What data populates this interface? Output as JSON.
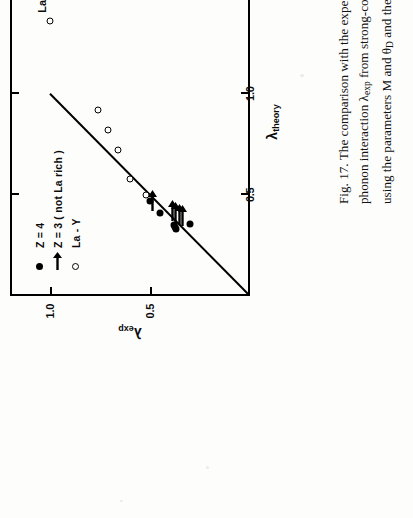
{
  "figure": {
    "number": "Fig. 17.",
    "caption_lines": [
      "Fig. 17.   The comparison with the experimentally determined electron",
      "phonon interaction λexp from strong-coupling theory, with the prediction",
      "using the parameters M and θD and the empirical formula (Eq. 22) given",
      "in the text."
    ],
    "caption_l1": "Fig. 17.   The comparison with the experimentally determined electron",
    "caption_l2a": "phonon interaction ",
    "caption_l2lam": "λ",
    "caption_l2sub": "exp",
    "caption_l2b": " from strong-coupling theory, with the prediction",
    "caption_l3a": "using the parameters M and ",
    "caption_l3theta": "θ",
    "caption_l3sub": "D",
    "caption_l3b": " and the empirical formula (Eq. 22) given",
    "caption_l4": "in the text."
  },
  "axes": {
    "x": {
      "title_symbol": "λ",
      "title_sub": "theory",
      "ticks": [
        "0.5",
        "1.0",
        "1.5"
      ],
      "tick_values": [
        0.5,
        1.0,
        1.5
      ],
      "range": [
        0,
        1.72
      ]
    },
    "y": {
      "title_symbol": "λ",
      "title_sub": "exp",
      "ticks": [
        "0.5",
        "1.0"
      ],
      "tick_values": [
        0.5,
        1.0
      ],
      "range": [
        0,
        1.2
      ]
    }
  },
  "legend": {
    "items": [
      {
        "symbol": "filled-circle",
        "label": "Z = 4"
      },
      {
        "symbol": "right-arrow",
        "label": "Z = 3  ( not La rich )"
      },
      {
        "symbol": "open-circle",
        "label": "La - Y"
      }
    ]
  },
  "annotations": [
    {
      "text": "La",
      "x": 1.36,
      "y": 1.04
    }
  ],
  "chart_data": {
    "type": "scatter",
    "title": "",
    "xlabel": "λ_theory",
    "ylabel": "λ_exp",
    "xlim": [
      0,
      1.72
    ],
    "ylim": [
      0,
      1.2
    ],
    "grid": false,
    "legend_position": "upper-left",
    "reference_line": {
      "label": "1:1 line",
      "x": [
        0.0,
        1.0
      ],
      "y": [
        0.0,
        1.0
      ]
    },
    "series": [
      {
        "name": "Z = 4",
        "marker": "filled-circle",
        "points": [
          {
            "x": 0.47,
            "y": 0.5
          },
          {
            "x": 0.41,
            "y": 0.45
          },
          {
            "x": 0.35,
            "y": 0.38
          },
          {
            "x": 0.34,
            "y": 0.375
          },
          {
            "x": 0.33,
            "y": 0.37
          },
          {
            "x": 0.355,
            "y": 0.3
          }
        ]
      },
      {
        "name": "Z = 3 ( not La rich )",
        "marker": "right-arrow",
        "points": [
          {
            "x": 0.43,
            "y": 0.49
          },
          {
            "x": 0.38,
            "y": 0.39
          },
          {
            "x": 0.37,
            "y": 0.375
          },
          {
            "x": 0.36,
            "y": 0.355
          },
          {
            "x": 0.355,
            "y": 0.34
          }
        ]
      },
      {
        "name": "La - Y",
        "marker": "open-circle",
        "points": [
          {
            "x": 0.5,
            "y": 0.52
          },
          {
            "x": 0.58,
            "y": 0.6
          },
          {
            "x": 0.72,
            "y": 0.66
          },
          {
            "x": 0.82,
            "y": 0.71
          },
          {
            "x": 0.92,
            "y": 0.76
          },
          {
            "x": 1.36,
            "y": 1.0
          }
        ]
      }
    ]
  }
}
